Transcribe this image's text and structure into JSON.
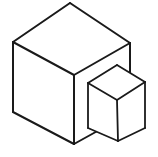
{
  "image": {
    "title": "Two isometric cubes line drawing",
    "description": "Black-outline wireframe-style drawing of a large isometric cube with a smaller isometric cube overlapping its lower right front face",
    "width": 158,
    "height": 157,
    "background_color": "#ffffff",
    "stroke_color": "#1a1a1a",
    "fill_color": "#ffffff",
    "stroke_width": 2
  },
  "shapes": {
    "large_cube": {
      "name": "large-cube",
      "label": "Large cube",
      "vertices": {
        "top": "70,3",
        "left_top": "13,42",
        "right_top": "130,43",
        "center_top": "74,75",
        "left_bottom": "13,112",
        "bottom": "74,144",
        "right_bottom": "130,113"
      },
      "top_face": "70,3 13,42 74,75 130,43",
      "left_face": "13,42 13,112 74,144 74,75",
      "right_face": "74,75 74,144 130,113 130,43",
      "edges": [
        "70,3 13,42",
        "70,3 130,43",
        "13,42 74,75",
        "130,43 74,75",
        "13,42 13,112",
        "13,112 74,144",
        "74,75 74,144",
        "130,43 130,113",
        "74,144 130,113"
      ]
    },
    "small_cube": {
      "name": "small-cube",
      "label": "Small cube",
      "vertices": {
        "top": "117,65",
        "left_top": "88,83",
        "right_top": "145,82",
        "center_top": "117,100",
        "left_bottom": "88,128",
        "bottom": "118,141",
        "right_bottom": "145,128"
      },
      "top_face": "117,65 88,83 117,100 145,82",
      "left_face": "88,83 88,128 118,141 117,100",
      "right_face": "117,100 118,141 145,128 145,82",
      "edges": [
        "117,65 88,83",
        "117,65 145,82",
        "88,83 117,100",
        "145,82 117,100",
        "88,83 88,128",
        "88,128 118,141",
        "117,100 118,141",
        "145,82 145,128",
        "118,141 145,128"
      ]
    }
  }
}
